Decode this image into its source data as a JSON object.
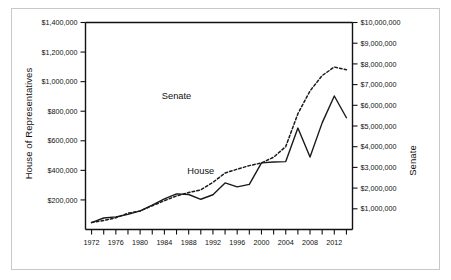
{
  "chart_data": {
    "type": "line",
    "title": "",
    "subtitle": "",
    "xlabel": "",
    "ylabel": "House of Representatives",
    "y2label": "Senate",
    "grid": false,
    "legend_position": "inline-annotation",
    "x": [
      1972,
      1974,
      1976,
      1978,
      1980,
      1982,
      1984,
      1986,
      1988,
      1990,
      1992,
      1994,
      1996,
      1998,
      2000,
      2002,
      2004,
      2006,
      2008,
      2010,
      2012,
      2014
    ],
    "xtick_labels": [
      "1972",
      "1976",
      "1980",
      "1984",
      "1988",
      "1992",
      "1996",
      "2000",
      "2004",
      "2008",
      "2012"
    ],
    "xtick_values": [
      1972,
      1976,
      1980,
      1984,
      1988,
      1992,
      1996,
      2000,
      2004,
      2008,
      2012
    ],
    "xminor_values": [
      1974,
      1978,
      1982,
      1986,
      1990,
      1994,
      1998,
      2002,
      2006,
      2010,
      2014
    ],
    "xlim": [
      1971,
      2015
    ],
    "ylim": [
      0,
      1400000
    ],
    "ytick_labels": [
      "$200,000",
      "$400,000",
      "$600,000",
      "$800,000",
      "$1,000,000",
      "$1,200,000",
      "$1,400,000"
    ],
    "ytick_values": [
      200000,
      400000,
      600000,
      800000,
      1000000,
      1200000,
      1400000
    ],
    "y2lim": [
      0,
      10000000
    ],
    "y2tick_labels": [
      "$1,000,000",
      "$2,000,000",
      "$3,000,000",
      "$4,000,000",
      "$5,000,000",
      "$6,000,000",
      "$7,000,000",
      "$8,000,000",
      "$9,000,000",
      "$10,000,000"
    ],
    "y2tick_values": [
      1000000,
      2000000,
      3000000,
      4000000,
      5000000,
      6000000,
      7000000,
      8000000,
      9000000,
      10000000
    ],
    "series": [
      {
        "name": "Senate",
        "axis": "right",
        "style": "solid",
        "color": "#1a1a1a",
        "values": [
          330000,
          555000,
          610000,
          730000,
          900000,
          1180000,
          1480000,
          1720000,
          1690000,
          1460000,
          1680000,
          2250000,
          2060000,
          2180000,
          3220000,
          3260000,
          3280000,
          4900000,
          3500000,
          5150000,
          6450000,
          5400000
        ]
      },
      {
        "name": "House",
        "axis": "left",
        "style": "dashed",
        "color": "#1a1a1a",
        "values": [
          48000,
          61000,
          79000,
          110000,
          125000,
          161000,
          195000,
          227000,
          250000,
          268000,
          319000,
          382000,
          408000,
          432000,
          450000,
          489000,
          561000,
          783000,
          937000,
          1041000,
          1099000,
          1081000
        ]
      }
    ],
    "annotations": [
      {
        "text": "Senate",
        "x": 1986,
        "y_axis_frac": 0.63
      },
      {
        "text": "House",
        "x": 1990,
        "y_axis_frac": 0.27
      }
    ]
  },
  "axis_titles": {
    "left": "House of Representatives",
    "right": "Senate"
  },
  "colors": {
    "line": "#1a1a1a",
    "axis": "#111111",
    "border": "#c8c8c8",
    "background": "#ffffff"
  }
}
